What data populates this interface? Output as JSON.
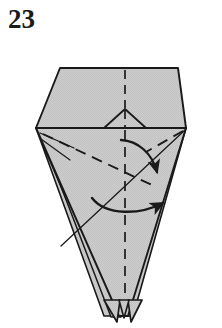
{
  "figure": {
    "number": "23",
    "type": "origami-fold-diagram",
    "caption": ""
  },
  "colors": {
    "paper_fill": "#c9c9c9",
    "paper_fill_light": "#d2d2d2",
    "outline": "#1a1a1a",
    "fold_line": "#1a1a1a",
    "arrow": "#1a1a1a",
    "background": "#ffffff",
    "number_color": "#1a1a1a"
  },
  "shapes": {
    "top_panel": {
      "name": "hexagonal-top-flap",
      "points": "60,68 178,68 186,128 36,128",
      "fill": "#cbcbcb"
    },
    "body_panel": {
      "name": "kite-body",
      "points": "36,128 186,128 124,318 120,318",
      "fill": "#c9c9c9"
    },
    "left_layer_a": {
      "name": "left-layer-edge-outer",
      "points": "36,128 112,318 106,318"
    },
    "left_layer_b": {
      "name": "left-layer-edge-middle",
      "points": "40,130 118,318 113,318"
    },
    "right_layer": {
      "name": "right-layer-edge",
      "points": "186,128 131,318 127,318"
    },
    "center_triangle": {
      "name": "small-center-triangle",
      "points": "104,128 125,109 146,128"
    }
  },
  "fold_lines": [
    {
      "name": "vertical-center-crease",
      "style": "dashed",
      "from": [
        125,
        68
      ],
      "to": [
        125,
        308
      ]
    },
    {
      "name": "left-diagonal-valley-crease",
      "style": "dashed",
      "from": [
        42,
        133
      ],
      "to": [
        150,
        183
      ]
    },
    {
      "name": "horizontal-flap-edge",
      "style": "solid",
      "from": [
        36,
        128
      ],
      "to": [
        186,
        128
      ]
    },
    {
      "name": "left-corner-to-right-corner-diagonal",
      "style": "solid",
      "from": [
        60,
        243
      ],
      "to": [
        186,
        130
      ]
    }
  ],
  "arrows": [
    {
      "name": "upper-fold-arrow",
      "direction": "curve-down-right",
      "description": "curved arrow sweeping from center crease down to the right",
      "start": [
        121,
        141
      ],
      "end": [
        158,
        175
      ]
    },
    {
      "name": "lower-fold-arrow",
      "direction": "curve-left-to-right",
      "description": "curved arrow sweeping horizontally from left across to the right",
      "start": [
        92,
        199
      ],
      "end": [
        167,
        206
      ]
    }
  ],
  "bottom_points": {
    "name": "layered-bottom-tips",
    "count": 3,
    "description": "narrow layered paper tips at the bottom apex"
  }
}
